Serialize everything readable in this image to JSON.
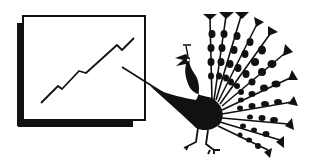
{
  "illustration": {
    "subject": "Peacock pointing a stick at a chart board showing a rising line",
    "colors": {
      "ink": "#111111",
      "paper": "#ffffff"
    }
  },
  "chart_board": {
    "line_points": [
      [
        41,
        103
      ],
      [
        58,
        86
      ],
      [
        62,
        89
      ],
      [
        79,
        71
      ],
      [
        86,
        73
      ],
      [
        117,
        45
      ],
      [
        122,
        50
      ],
      [
        134,
        38
      ]
    ]
  },
  "icons": [
    "chart-board-icon",
    "peacock-icon",
    "pointer-stick-icon"
  ]
}
